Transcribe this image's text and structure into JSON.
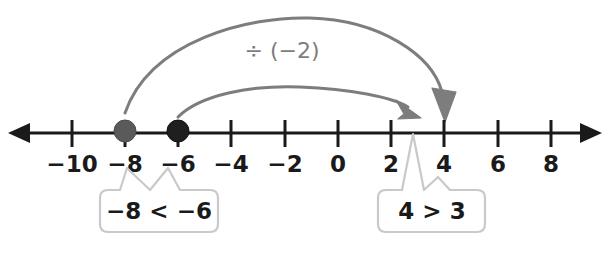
{
  "figure": {
    "type": "number-line-diagram",
    "title": "",
    "operation_label": "÷ (−2)"
  },
  "number_line": {
    "min": -11,
    "max": -11,
    "tick_values": [
      "-10",
      "-8",
      "-6",
      "-4",
      "-2",
      "0",
      "2",
      "4",
      "6",
      "8"
    ],
    "tick_labels": {
      "t0": "−10",
      "t1": "−8",
      "t2": "−6",
      "t3": "−4",
      "t4": "−2",
      "t5": "0",
      "t6": "2",
      "t7": "4",
      "t8": "6",
      "t9": "8"
    },
    "left_arrow": "left-arrowhead",
    "right_arrow": "right-arrowhead",
    "points": [
      {
        "name": "point-minus-8",
        "value": "-8",
        "color": "#5a5a5a"
      },
      {
        "name": "point-minus-6",
        "value": "-6",
        "color": "#1f1f1f"
      }
    ]
  },
  "arcs": [
    {
      "name": "outer-arc",
      "from_value": "-8",
      "to_value": "4",
      "color": "#7d7d7d",
      "arrowhead": "down-arrowhead"
    },
    {
      "name": "inner-arc",
      "from_value": "-6",
      "to_value": "3",
      "color": "#7d7d7d",
      "arrowhead": "right-arrowhead"
    }
  ],
  "callouts": [
    {
      "name": "callout-left",
      "text": "−8 < −6",
      "points_to": [
        "-8",
        "-6"
      ],
      "border_color": "#c9c9c9"
    },
    {
      "name": "callout-right",
      "text": "4 > 3",
      "points_to": [
        "3",
        "4"
      ],
      "border_color": "#c9c9c9"
    }
  ]
}
